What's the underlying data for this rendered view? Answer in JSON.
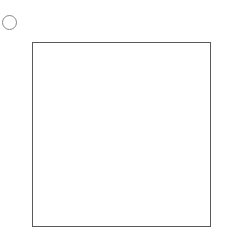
{
  "label": "い",
  "colors": {
    "filled": "#d6d6d6",
    "empty": "#ffffff",
    "grid_line": "#5a5a5a",
    "circle": "#808080"
  },
  "top_circles": [
    46,
    72,
    97,
    123,
    149,
    174,
    199,
    225
  ],
  "top_circle_y": 30,
  "right_circles": [
    56,
    82,
    109,
    135,
    161,
    187,
    214
  ],
  "right_circle_x": 225,
  "grid": [
    [
      1,
      1,
      1,
      1,
      1,
      1,
      1
    ],
    [
      1,
      1,
      1,
      1,
      1,
      0,
      1
    ],
    [
      0,
      1,
      1,
      1,
      1,
      1,
      1
    ],
    [
      1,
      1,
      1,
      0,
      1,
      1,
      1
    ],
    [
      0,
      1,
      1,
      0,
      1,
      0,
      1
    ],
    [
      1,
      1,
      1,
      1,
      1,
      1,
      1
    ],
    [
      0,
      1,
      1,
      0,
      1,
      0,
      1
    ]
  ]
}
